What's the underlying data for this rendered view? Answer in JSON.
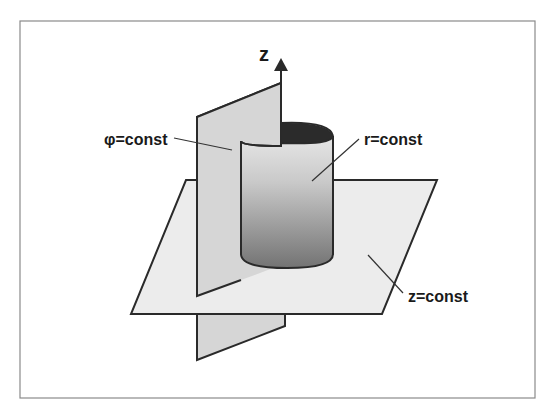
{
  "diagram": {
    "axis_label": "z",
    "labels": {
      "phi": "φ=const",
      "r": "r=const",
      "z": "z=const"
    },
    "colors": {
      "frame": "#8a8a8a",
      "outline": "#2a2a2a",
      "plane_horizontal": "#ececec",
      "plane_vertical": "#d6d6d6",
      "cylinder_light": "#e4e4e4",
      "cylinder_dark": "#7a7a7a",
      "cylinder_inside": "#2b2b2b"
    }
  }
}
